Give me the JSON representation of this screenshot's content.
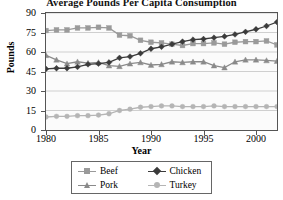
{
  "chart_data": {
    "type": "line",
    "title": "Average Pounds Per Capita Consumption",
    "xlabel": "Year",
    "ylabel": "Pounds",
    "xlim": [
      1980,
      2002
    ],
    "ylim": [
      0,
      90
    ],
    "ytick_labels": [
      "0",
      "15",
      "30",
      "45",
      "60",
      "75",
      "90"
    ],
    "ytick_values": [
      0,
      15,
      30,
      45,
      60,
      75,
      90
    ],
    "xtick_labels": [
      "1980",
      "1985",
      "1990",
      "1995",
      "2000"
    ],
    "xtick_values": [
      1980,
      1985,
      1990,
      1995,
      2000
    ],
    "grid": true,
    "legend_position": "bottom",
    "x": [
      1980,
      1981,
      1982,
      1983,
      1984,
      1985,
      1986,
      1987,
      1988,
      1989,
      1990,
      1991,
      1992,
      1993,
      1994,
      1995,
      1996,
      1997,
      1998,
      1999,
      2000,
      2001,
      2002
    ],
    "series": [
      {
        "name": "Beef",
        "color": "#9a9a9a",
        "marker": "square",
        "values": [
          76.5,
          77.0,
          77.0,
          78.5,
          78.5,
          79.0,
          78.5,
          73.0,
          72.5,
          69.0,
          67.5,
          67.0,
          66.0,
          65.0,
          66.5,
          66.5,
          67.0,
          66.0,
          67.5,
          68.0,
          68.0,
          68.5,
          65.5
        ]
      },
      {
        "name": "Chicken",
        "color": "#3b3b3b",
        "marker": "diamond",
        "values": [
          47.0,
          47.5,
          47.5,
          48.5,
          50.5,
          51.0,
          52.0,
          55.5,
          56.5,
          59.0,
          62.5,
          64.0,
          66.0,
          68.0,
          69.5,
          70.0,
          71.0,
          72.0,
          73.5,
          75.5,
          77.5,
          80.0,
          83.0
        ]
      },
      {
        "name": "Pork",
        "color": "#8a8a8a",
        "marker": "triangle",
        "values": [
          57.5,
          54.0,
          51.0,
          52.5,
          51.5,
          52.0,
          49.5,
          49.0,
          51.0,
          52.0,
          50.0,
          50.5,
          52.5,
          52.0,
          52.5,
          52.5,
          49.5,
          48.0,
          52.5,
          54.0,
          54.0,
          53.5,
          53.0
        ]
      },
      {
        "name": "Turkey",
        "color": "#b5b5b5",
        "marker": "circle",
        "values": [
          10.0,
          10.5,
          10.5,
          11.0,
          11.0,
          11.5,
          12.5,
          15.0,
          16.0,
          17.5,
          18.0,
          18.5,
          18.5,
          18.0,
          18.0,
          18.0,
          18.5,
          18.0,
          18.0,
          18.0,
          18.0,
          18.0,
          18.0
        ]
      }
    ]
  },
  "legend": {
    "items": [
      {
        "label": "Beef"
      },
      {
        "label": "Chicken"
      },
      {
        "label": "Pork"
      },
      {
        "label": "Turkey"
      }
    ]
  }
}
